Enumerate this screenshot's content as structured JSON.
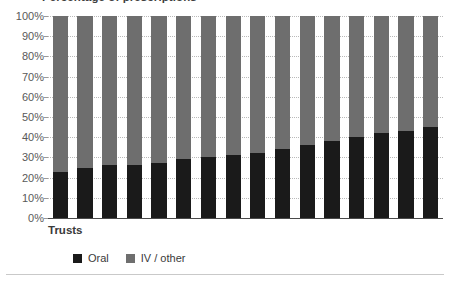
{
  "chart_data": {
    "type": "bar",
    "subtype": "stacked-percentage",
    "title": "Percentage of prescriptions",
    "xlabel": "Trusts",
    "ylabel": "",
    "ylim": [
      0,
      100
    ],
    "grid": true,
    "legend_position": "bottom",
    "categories": [
      "Trust 1",
      "Trust 2",
      "Trust 3",
      "Trust 4",
      "Trust 5",
      "Trust 6",
      "Trust 7",
      "Trust 8",
      "Trust 9",
      "Trust 10",
      "Trust 11",
      "Trust 12",
      "Trust 13",
      "Trust 14",
      "Trust 15",
      "Trust 16"
    ],
    "y_ticks": [
      "0%",
      "10%",
      "20%",
      "30%",
      "40%",
      "50%",
      "60%",
      "70%",
      "80%",
      "90%",
      "100%"
    ],
    "y_tick_values": [
      0,
      10,
      20,
      30,
      40,
      50,
      60,
      70,
      80,
      90,
      100
    ],
    "series": [
      {
        "name": "Oral",
        "color": "#1a1a1a",
        "values": [
          23,
          25,
          26,
          26,
          27,
          29,
          30,
          31,
          32,
          34,
          36,
          38,
          40,
          42,
          43,
          45
        ]
      },
      {
        "name": "IV / other",
        "color": "#6e6e6e",
        "values": [
          77,
          75,
          74,
          74,
          73,
          71,
          70,
          69,
          68,
          66,
          64,
          62,
          60,
          58,
          57,
          55
        ]
      }
    ]
  },
  "legend": {
    "items": [
      {
        "label": "Oral",
        "color": "#1a1a1a"
      },
      {
        "label": "IV / other",
        "color": "#6e6e6e"
      }
    ]
  }
}
